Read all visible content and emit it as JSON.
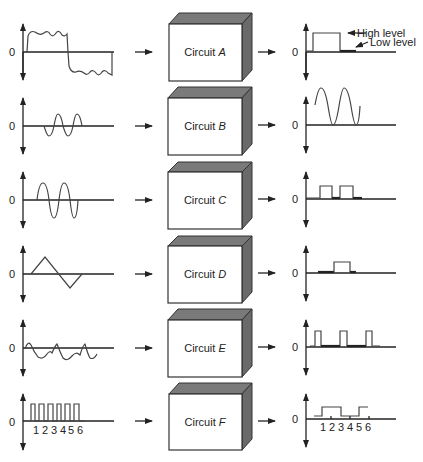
{
  "diagram": {
    "rows": [
      {
        "id": "A",
        "circuit_prefix": "Circuit",
        "circuit_letter": "A",
        "input": "noisy square wave",
        "output": "clean pulse",
        "zero": "0"
      },
      {
        "id": "B",
        "circuit_prefix": "Circuit",
        "circuit_letter": "B",
        "input": "small sine wave",
        "output": "amplified, DC-shifted sine wave",
        "zero": "0"
      },
      {
        "id": "C",
        "circuit_prefix": "Circuit",
        "circuit_letter": "C",
        "input": "sine wave",
        "output": "square pulses",
        "zero": "0"
      },
      {
        "id": "D",
        "circuit_prefix": "Circuit",
        "circuit_letter": "D",
        "input": "triangle wave",
        "output": "single pulse",
        "zero": "0"
      },
      {
        "id": "E",
        "circuit_prefix": "Circuit",
        "circuit_letter": "E",
        "input": "irregular wave",
        "output": "regular pulses",
        "zero": "0"
      },
      {
        "id": "F",
        "circuit_prefix": "Circuit",
        "circuit_letter": "F",
        "input": "pulse train",
        "output": "divided pulse train",
        "zero": "0"
      }
    ],
    "annotations": {
      "high_level": "High level",
      "low_level": "Low level"
    },
    "pulse_numbers": [
      "1",
      "2",
      "3",
      "4",
      "5",
      "6"
    ]
  }
}
